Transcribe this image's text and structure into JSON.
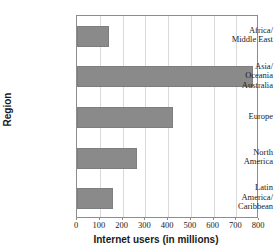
{
  "chart_data": {
    "type": "bar",
    "orientation": "horizontal",
    "title": "",
    "xlabel": "Internet users (in millions)",
    "ylabel": "Region",
    "categories": [
      "Africa/\nMiddle East",
      "Asia/\nOceania\nAustralia",
      "Europe",
      "North\nAmerica",
      "Latin\nAmerica/\nCaribbean"
    ],
    "values": [
      140,
      775,
      422,
      264,
      158
    ],
    "xlim": [
      0,
      800
    ],
    "xticks": [
      0,
      100,
      200,
      300,
      400,
      500,
      600,
      700,
      800
    ],
    "xtick_labels": [
      "0",
      "100",
      "200",
      "300",
      "400",
      "500",
      "600",
      "700",
      "800"
    ],
    "grid": "vertical",
    "legend": "none",
    "bar_color": "#8a8a8a",
    "frame_color": "#8d8d8d",
    "gridline_color": "#d9d9d9"
  },
  "axes": {
    "x_title": "Internet users (in millions)",
    "y_title": "Region"
  },
  "title": {
    "text": ""
  }
}
